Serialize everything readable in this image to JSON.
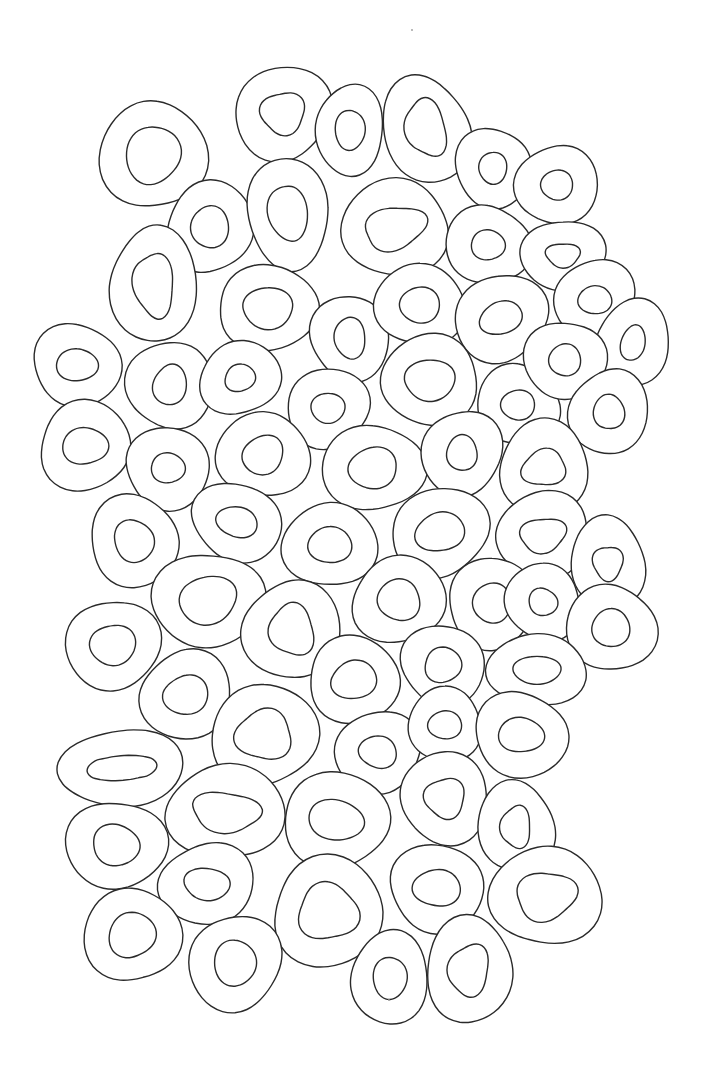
{
  "artwork": {
    "kind": "coloring-page line art",
    "subject": "overlapping organic rings (donut / cell shapes)",
    "background": "#ffffff",
    "stroke": "#2a2a2a",
    "ring_count": 80
  },
  "rings": [
    {
      "cx": 153,
      "cy": 155,
      "rx": 52,
      "ry": 55,
      "rot": -10,
      "irx": 27,
      "iry": 29,
      "ix": 0,
      "iy": 0,
      "ishape": "blob"
    },
    {
      "cx": 283,
      "cy": 113,
      "rx": 48,
      "ry": 47,
      "rot": -10,
      "irx": 22,
      "iry": 21,
      "ix": 0,
      "iy": 0,
      "ishape": "tri"
    },
    {
      "cx": 350,
      "cy": 130,
      "rx": 35,
      "ry": 44,
      "rot": 0,
      "irx": 15,
      "iry": 20,
      "ix": 0,
      "iy": 0,
      "ishape": "oval"
    },
    {
      "cx": 426,
      "cy": 130,
      "rx": 44,
      "ry": 53,
      "rot": -15,
      "irx": 20,
      "iry": 29,
      "ix": 0,
      "iy": -2,
      "ishape": "tri"
    },
    {
      "cx": 493,
      "cy": 168,
      "rx": 37,
      "ry": 41,
      "rot": 0,
      "irx": 14,
      "iry": 16,
      "ix": 0,
      "iy": 0,
      "ishape": "oval"
    },
    {
      "cx": 557,
      "cy": 185,
      "rx": 40,
      "ry": 41,
      "rot": 0,
      "irx": 16,
      "iry": 15,
      "ix": 0,
      "iy": 0,
      "ishape": "oval"
    },
    {
      "cx": 210,
      "cy": 227,
      "rx": 43,
      "ry": 46,
      "rot": 0,
      "irx": 19,
      "iry": 21,
      "ix": 0,
      "iy": 0,
      "ishape": "oval"
    },
    {
      "cx": 288,
      "cy": 213,
      "rx": 42,
      "ry": 54,
      "rot": -8,
      "irx": 19,
      "iry": 29,
      "ix": 0,
      "iy": 0,
      "ishape": "blob"
    },
    {
      "cx": 395,
      "cy": 228,
      "rx": 54,
      "ry": 48,
      "rot": -15,
      "irx": 31,
      "iry": 21,
      "ix": 0,
      "iy": 0,
      "ishape": "tri"
    },
    {
      "cx": 488,
      "cy": 245,
      "rx": 42,
      "ry": 40,
      "rot": 0,
      "irx": 17,
      "iry": 15,
      "ix": 0,
      "iy": 0,
      "ishape": "oval"
    },
    {
      "cx": 563,
      "cy": 255,
      "rx": 41,
      "ry": 36,
      "rot": 0,
      "irx": 17,
      "iry": 12,
      "ix": 0,
      "iy": 0,
      "ishape": "tri"
    },
    {
      "cx": 154,
      "cy": 285,
      "rx": 44,
      "ry": 57,
      "rot": -5,
      "irx": 20,
      "iry": 32,
      "ix": 0,
      "iy": 0,
      "ishape": "tri"
    },
    {
      "cx": 268,
      "cy": 308,
      "rx": 52,
      "ry": 41,
      "rot": 0,
      "irx": 26,
      "iry": 20,
      "ix": 0,
      "iy": 0,
      "ishape": "blob"
    },
    {
      "cx": 350,
      "cy": 338,
      "rx": 40,
      "ry": 42,
      "rot": 0,
      "irx": 16,
      "iry": 20,
      "ix": 0,
      "iy": 0,
      "ishape": "blob"
    },
    {
      "cx": 420,
      "cy": 305,
      "rx": 44,
      "ry": 42,
      "rot": 0,
      "irx": 20,
      "iry": 18,
      "ix": 0,
      "iy": 0,
      "ishape": "oval"
    },
    {
      "cx": 501,
      "cy": 318,
      "rx": 46,
      "ry": 44,
      "rot": -20,
      "irx": 22,
      "iry": 16,
      "ix": 0,
      "iy": 0,
      "ishape": "oval"
    },
    {
      "cx": 595,
      "cy": 300,
      "rx": 41,
      "ry": 40,
      "rot": 0,
      "irx": 17,
      "iry": 14,
      "ix": 0,
      "iy": 0,
      "ishape": "oval"
    },
    {
      "cx": 633,
      "cy": 343,
      "rx": 38,
      "ry": 42,
      "rot": 15,
      "irx": 12,
      "iry": 18,
      "ix": 0,
      "iy": 0,
      "ishape": "oval"
    },
    {
      "cx": 77,
      "cy": 365,
      "rx": 44,
      "ry": 41,
      "rot": 0,
      "irx": 21,
      "iry": 16,
      "ix": 0,
      "iy": 0,
      "ishape": "oval"
    },
    {
      "cx": 170,
      "cy": 385,
      "rx": 42,
      "ry": 45,
      "rot": 0,
      "irx": 17,
      "iry": 20,
      "ix": 0,
      "iy": 0,
      "ishape": "blob"
    },
    {
      "cx": 240,
      "cy": 378,
      "rx": 40,
      "ry": 37,
      "rot": -10,
      "irx": 16,
      "iry": 13,
      "ix": 0,
      "iy": 0,
      "ishape": "blob"
    },
    {
      "cx": 328,
      "cy": 408,
      "rx": 42,
      "ry": 39,
      "rot": 0,
      "irx": 17,
      "iry": 15,
      "ix": 0,
      "iy": 0,
      "ishape": "oval"
    },
    {
      "cx": 430,
      "cy": 380,
      "rx": 50,
      "ry": 44,
      "rot": -10,
      "irx": 26,
      "iry": 20,
      "ix": 0,
      "iy": 0,
      "ishape": "blob"
    },
    {
      "cx": 518,
      "cy": 405,
      "rx": 41,
      "ry": 40,
      "rot": 0,
      "irx": 17,
      "iry": 15,
      "ix": 0,
      "iy": 0,
      "ishape": "oval"
    },
    {
      "cx": 565,
      "cy": 360,
      "rx": 40,
      "ry": 40,
      "rot": 0,
      "irx": 16,
      "iry": 16,
      "ix": 0,
      "iy": 0,
      "ishape": "oval"
    },
    {
      "cx": 609,
      "cy": 412,
      "rx": 39,
      "ry": 43,
      "rot": 0,
      "irx": 15,
      "iry": 18,
      "ix": 0,
      "iy": 0,
      "ishape": "blob"
    },
    {
      "cx": 85,
      "cy": 446,
      "rx": 46,
      "ry": 44,
      "rot": 0,
      "irx": 22,
      "iry": 19,
      "ix": 0,
      "iy": 0,
      "ishape": "blob"
    },
    {
      "cx": 168,
      "cy": 468,
      "rx": 43,
      "ry": 40,
      "rot": 0,
      "irx": 17,
      "iry": 15,
      "ix": 0,
      "iy": 0,
      "ishape": "oval"
    },
    {
      "cx": 263,
      "cy": 455,
      "rx": 46,
      "ry": 43,
      "rot": -15,
      "irx": 21,
      "iry": 19,
      "ix": 0,
      "iy": 0,
      "ishape": "blob"
    },
    {
      "cx": 373,
      "cy": 468,
      "rx": 50,
      "ry": 44,
      "rot": 0,
      "irx": 25,
      "iry": 20,
      "ix": 0,
      "iy": 0,
      "ishape": "blob"
    },
    {
      "cx": 462,
      "cy": 453,
      "rx": 40,
      "ry": 43,
      "rot": 0,
      "irx": 16,
      "iry": 17,
      "ix": 0,
      "iy": 0,
      "ishape": "blob"
    },
    {
      "cx": 544,
      "cy": 468,
      "rx": 46,
      "ry": 46,
      "rot": -10,
      "irx": 22,
      "iry": 18,
      "ix": 0,
      "iy": 0,
      "ishape": "tri"
    },
    {
      "cx": 134,
      "cy": 541,
      "rx": 45,
      "ry": 45,
      "rot": 0,
      "irx": 20,
      "iry": 21,
      "ix": 0,
      "iy": 0,
      "ishape": "blob"
    },
    {
      "cx": 237,
      "cy": 522,
      "rx": 45,
      "ry": 39,
      "rot": 15,
      "irx": 21,
      "iry": 15,
      "ix": 0,
      "iy": 0,
      "ishape": "oval"
    },
    {
      "cx": 330,
      "cy": 545,
      "rx": 46,
      "ry": 43,
      "rot": 0,
      "irx": 22,
      "iry": 18,
      "ix": 0,
      "iy": 0,
      "ishape": "oval"
    },
    {
      "cx": 440,
      "cy": 532,
      "rx": 49,
      "ry": 44,
      "rot": -10,
      "irx": 24,
      "iry": 20,
      "ix": 0,
      "iy": 0,
      "ishape": "blob"
    },
    {
      "cx": 543,
      "cy": 535,
      "rx": 48,
      "ry": 42,
      "rot": -10,
      "irx": 23,
      "iry": 17,
      "ix": 0,
      "iy": 0,
      "ishape": "tri"
    },
    {
      "cx": 608,
      "cy": 563,
      "rx": 38,
      "ry": 45,
      "rot": 0,
      "irx": 15,
      "iry": 17,
      "ix": 0,
      "iy": 0,
      "ishape": "tri"
    },
    {
      "cx": 208,
      "cy": 600,
      "rx": 55,
      "ry": 48,
      "rot": -10,
      "irx": 30,
      "iry": 23,
      "ix": 0,
      "iy": 0,
      "ishape": "blob"
    },
    {
      "cx": 292,
      "cy": 630,
      "rx": 48,
      "ry": 50,
      "rot": -15,
      "irx": 22,
      "iry": 26,
      "ix": 0,
      "iy": 0,
      "ishape": "tri"
    },
    {
      "cx": 399,
      "cy": 600,
      "rx": 47,
      "ry": 43,
      "rot": 0,
      "irx": 22,
      "iry": 20,
      "ix": 0,
      "iy": 0,
      "ishape": "blob"
    },
    {
      "cx": 492,
      "cy": 603,
      "rx": 45,
      "ry": 44,
      "rot": 0,
      "irx": 19,
      "iry": 20,
      "ix": 0,
      "iy": 0,
      "ishape": "oval"
    },
    {
      "cx": 543,
      "cy": 602,
      "rx": 38,
      "ry": 38,
      "rot": 0,
      "irx": 14,
      "iry": 14,
      "ix": 0,
      "iy": 0,
      "ishape": "blob"
    },
    {
      "cx": 611,
      "cy": 628,
      "rx": 44,
      "ry": 44,
      "rot": 0,
      "irx": 19,
      "iry": 19,
      "ix": 0,
      "iy": 0,
      "ishape": "oval"
    },
    {
      "cx": 113,
      "cy": 645,
      "rx": 46,
      "ry": 46,
      "rot": 0,
      "irx": 22,
      "iry": 21,
      "ix": 0,
      "iy": 0,
      "ishape": "blob"
    },
    {
      "cx": 186,
      "cy": 695,
      "rx": 46,
      "ry": 44,
      "rot": 0,
      "irx": 22,
      "iry": 20,
      "ix": 0,
      "iy": 0,
      "ishape": "blob"
    },
    {
      "cx": 354,
      "cy": 680,
      "rx": 47,
      "ry": 42,
      "rot": 0,
      "irx": 23,
      "iry": 19,
      "ix": 0,
      "iy": 0,
      "ishape": "blob"
    },
    {
      "cx": 443,
      "cy": 665,
      "rx": 42,
      "ry": 40,
      "rot": 0,
      "irx": 19,
      "iry": 17,
      "ix": 0,
      "iy": 0,
      "ishape": "blob"
    },
    {
      "cx": 537,
      "cy": 670,
      "rx": 48,
      "ry": 37,
      "rot": 0,
      "irx": 24,
      "iry": 14,
      "ix": 0,
      "iy": 0,
      "ishape": "oval"
    },
    {
      "cx": 264,
      "cy": 735,
      "rx": 52,
      "ry": 52,
      "rot": 0,
      "irx": 28,
      "iry": 25,
      "ix": 0,
      "iy": 0,
      "ishape": "tri"
    },
    {
      "cx": 378,
      "cy": 752,
      "rx": 44,
      "ry": 40,
      "rot": 0,
      "irx": 19,
      "iry": 16,
      "ix": 0,
      "iy": 0,
      "ishape": "blob"
    },
    {
      "cx": 445,
      "cy": 725,
      "rx": 38,
      "ry": 36,
      "rot": 0,
      "irx": 17,
      "iry": 14,
      "ix": 0,
      "iy": 0,
      "ishape": "oval"
    },
    {
      "cx": 521,
      "cy": 735,
      "rx": 46,
      "ry": 43,
      "rot": 0,
      "irx": 22,
      "iry": 18,
      "ix": 0,
      "iy": 0,
      "ishape": "blob"
    },
    {
      "cx": 122,
      "cy": 768,
      "rx": 60,
      "ry": 40,
      "rot": -5,
      "irx": 35,
      "iry": 15,
      "ix": 0,
      "iy": 0,
      "ishape": "peanut"
    },
    {
      "cx": 226,
      "cy": 812,
      "rx": 58,
      "ry": 48,
      "rot": 5,
      "irx": 34,
      "iry": 20,
      "ix": 0,
      "iy": 0,
      "ishape": "tri"
    },
    {
      "cx": 336,
      "cy": 820,
      "rx": 54,
      "ry": 47,
      "rot": 10,
      "irx": 28,
      "iry": 20,
      "ix": 0,
      "iy": 0,
      "ishape": "oval"
    },
    {
      "cx": 445,
      "cy": 798,
      "rx": 45,
      "ry": 45,
      "rot": 0,
      "irx": 20,
      "iry": 20,
      "ix": 0,
      "iy": 0,
      "ishape": "tri"
    },
    {
      "cx": 516,
      "cy": 827,
      "rx": 38,
      "ry": 46,
      "rot": 0,
      "irx": 15,
      "iry": 21,
      "ix": 0,
      "iy": 0,
      "ishape": "tri"
    },
    {
      "cx": 116,
      "cy": 845,
      "rx": 49,
      "ry": 45,
      "rot": 0,
      "irx": 24,
      "iry": 20,
      "ix": 0,
      "iy": 0,
      "ishape": "blob"
    },
    {
      "cx": 207,
      "cy": 884,
      "rx": 47,
      "ry": 41,
      "rot": 0,
      "irx": 23,
      "iry": 16,
      "ix": 0,
      "iy": 0,
      "ishape": "blob"
    },
    {
      "cx": 328,
      "cy": 912,
      "rx": 56,
      "ry": 54,
      "rot": 0,
      "irx": 30,
      "iry": 28,
      "ix": 0,
      "iy": 0,
      "ishape": "tri"
    },
    {
      "cx": 437,
      "cy": 888,
      "rx": 48,
      "ry": 43,
      "rot": 0,
      "irx": 23,
      "iry": 19,
      "ix": 0,
      "iy": 0,
      "ishape": "blob"
    },
    {
      "cx": 546,
      "cy": 896,
      "rx": 55,
      "ry": 50,
      "rot": -10,
      "irx": 30,
      "iry": 24,
      "ix": 0,
      "iy": 0,
      "ishape": "tri"
    },
    {
      "cx": 132,
      "cy": 935,
      "rx": 47,
      "ry": 48,
      "rot": 0,
      "irx": 23,
      "iry": 23,
      "ix": 0,
      "iy": 0,
      "ishape": "blob"
    },
    {
      "cx": 235,
      "cy": 963,
      "rx": 46,
      "ry": 48,
      "rot": 0,
      "irx": 21,
      "iry": 23,
      "ix": 0,
      "iy": 0,
      "ishape": "oval"
    },
    {
      "cx": 390,
      "cy": 978,
      "rx": 40,
      "ry": 45,
      "rot": 0,
      "irx": 17,
      "iry": 21,
      "ix": 0,
      "iy": 0,
      "ishape": "oval"
    },
    {
      "cx": 469,
      "cy": 970,
      "rx": 44,
      "ry": 52,
      "rot": 10,
      "irx": 20,
      "iry": 26,
      "ix": 0,
      "iy": 0,
      "ishape": "tri"
    }
  ],
  "specks": [
    {
      "x": 412,
      "y": 30,
      "r": 0.9
    },
    {
      "x": 389,
      "y": 1000,
      "r": 0.9
    }
  ]
}
